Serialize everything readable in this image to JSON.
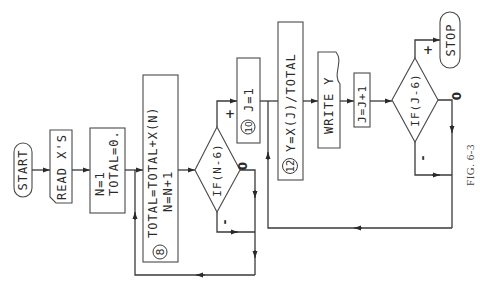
{
  "figure": {
    "caption": "FIG. 6-3",
    "nodes": {
      "start": {
        "label": "START"
      },
      "read": {
        "label": "READ X'S"
      },
      "init": {
        "line1": "N=1",
        "line2": "TOTAL=0."
      },
      "accumulate": {
        "step": "8",
        "line1": "TOTAL=TOTAL+X(N)",
        "line2": "N=N+1"
      },
      "if_n": {
        "label": "IF(N-6)"
      },
      "set_j": {
        "step": "10",
        "label": "J=1"
      },
      "compute_y": {
        "step": "12",
        "label": "Y=X(J)/TOTAL"
      },
      "write": {
        "label": "WRITE Y"
      },
      "incr_j": {
        "label": "J=J+1"
      },
      "if_j": {
        "label": "IF(J-6)"
      },
      "stop": {
        "label": "STOP"
      }
    },
    "branch_labels": {
      "if_n_plus": "+",
      "if_n_zero": "0",
      "if_n_minus": "-",
      "if_j_plus": "+",
      "if_j_zero": "0",
      "if_j_minus": "-"
    }
  }
}
